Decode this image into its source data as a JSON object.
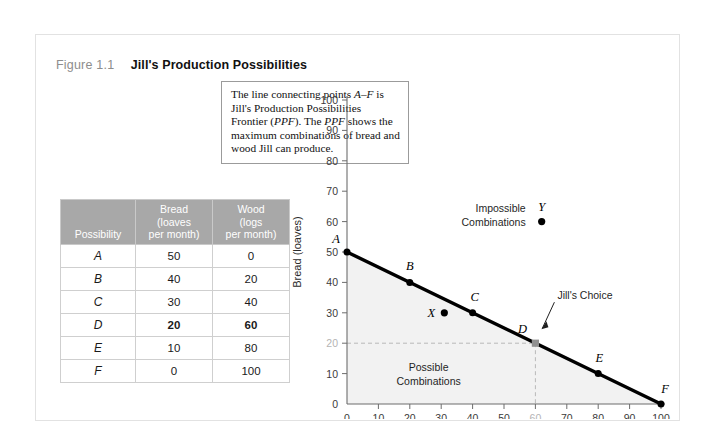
{
  "figure": {
    "number": "Figure 1.1",
    "title": "Jill's Production Possibilities"
  },
  "table": {
    "headers": {
      "possibility": "Possibility",
      "bread_line1": "Bread",
      "bread_line2": "(loaves",
      "bread_line3": "per month)",
      "wood_line1": "Wood",
      "wood_line2": "(logs",
      "wood_line3": "per month)"
    },
    "rows": [
      {
        "possibility": "A",
        "bread": "50",
        "wood": "0",
        "highlight": false
      },
      {
        "possibility": "B",
        "bread": "40",
        "wood": "20",
        "highlight": false
      },
      {
        "possibility": "C",
        "bread": "30",
        "wood": "40",
        "highlight": false
      },
      {
        "possibility": "D",
        "bread": "20",
        "wood": "60",
        "highlight": true
      },
      {
        "possibility": "E",
        "bread": "10",
        "wood": "80",
        "highlight": false
      },
      {
        "possibility": "F",
        "bread": "0",
        "wood": "100",
        "highlight": false
      }
    ]
  },
  "callout": {
    "line1_a": "The line connecting points ",
    "line1_em": "A–F",
    "line1_b": " is",
    "line2": "Jill's Production Possibilities Frontier",
    "line3_a": "(",
    "line3_em1": "PPF",
    "line3_b": "). The ",
    "line3_em2": "PPF",
    "line3_c": " shows the maximum",
    "line4": "combinations of bread and wood Jill",
    "line5": "can produce."
  },
  "annotations": {
    "impossible_line1": "Impossible",
    "impossible_line2": "Combinations",
    "possible_line1": "Possible",
    "possible_line2": "Combinations",
    "jills_choice": "Jill's Choice",
    "point_y": "Y",
    "point_x": "X"
  },
  "chart_data": {
    "type": "line",
    "title": "Jill's Production Possibilities",
    "xlabel": "Wood (logs)",
    "ylabel": "Bread (loaves)",
    "xlim": [
      0,
      100
    ],
    "ylim": [
      0,
      100
    ],
    "xticks": [
      0,
      10,
      20,
      30,
      40,
      50,
      60,
      70,
      80,
      90,
      100
    ],
    "yticks": [
      0,
      10,
      20,
      30,
      40,
      50,
      60,
      70,
      80,
      90,
      100
    ],
    "dim_xtick": 60,
    "dim_ytick": 20,
    "grid": false,
    "legend": "none",
    "series": [
      {
        "name": "PPF",
        "x": [
          0,
          20,
          40,
          60,
          80,
          100
        ],
        "values": [
          50,
          40,
          30,
          20,
          10,
          0
        ],
        "point_labels": [
          "A",
          "B",
          "C",
          "D",
          "E",
          "F"
        ]
      }
    ],
    "extra_points": [
      {
        "label": "X",
        "x": 31,
        "y": 30,
        "note": "Possible Combinations (inefficient)"
      },
      {
        "label": "Y",
        "x": 62,
        "y": 60,
        "note": "Impossible Combinations"
      }
    ],
    "highlight_point": {
      "label": "D",
      "x": 60,
      "y": 20,
      "note": "Jill's Choice"
    },
    "shaded_region": "area under the PPF = possible combinations"
  },
  "colors": {
    "frame_border": "#e2e2e2",
    "table_header_bg": "#a8a8a8",
    "ppf_line": "#000000",
    "guide_line": "#b9b9b9",
    "shaded_region": "#f2f2f2",
    "title_text": "#111111",
    "figure_number": "#8d8d8d"
  }
}
